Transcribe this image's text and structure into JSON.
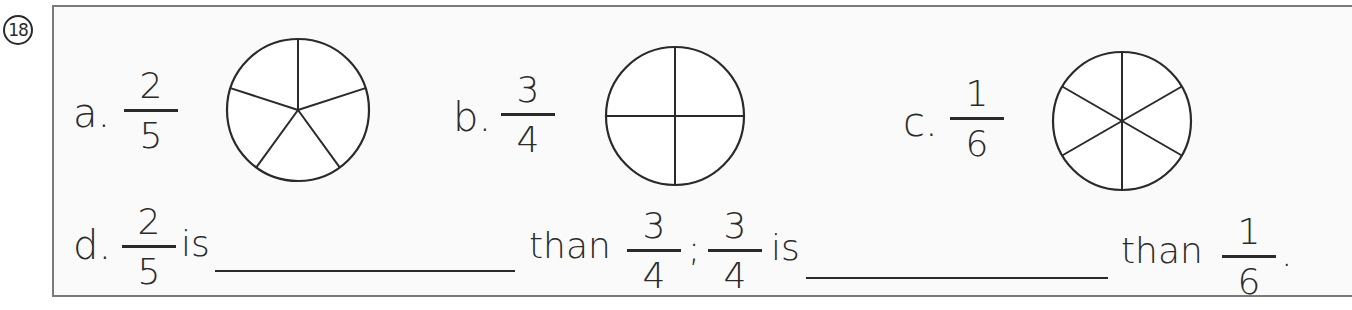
{
  "question_number": "18",
  "items": {
    "a": {
      "label": "a.",
      "numerator": "2",
      "denominator": "5",
      "pie_slices": 5
    },
    "b": {
      "label": "b.",
      "numerator": "3",
      "denominator": "4",
      "pie_slices": 4
    },
    "c": {
      "label": "c.",
      "numerator": "1",
      "denominator": "6",
      "pie_slices": 6
    }
  },
  "comparison": {
    "label": "d.",
    "frac1": {
      "numerator": "2",
      "denominator": "5"
    },
    "is_1": "is",
    "blank_1": "",
    "than_1": "than",
    "frac2": {
      "numerator": "3",
      "denominator": "4"
    },
    "separator": ";",
    "frac3": {
      "numerator": "3",
      "denominator": "4"
    },
    "is_2": "is",
    "blank_2": "",
    "than_2": "than",
    "frac4": {
      "numerator": "1",
      "denominator": "6"
    },
    "end": "."
  }
}
